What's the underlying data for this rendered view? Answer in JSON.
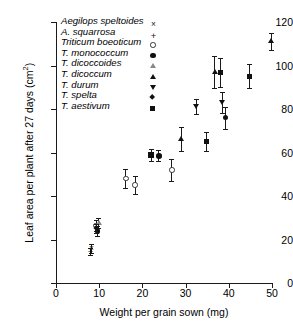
{
  "chart_data": {
    "type": "scatter",
    "title": "",
    "xlabel": "Weight per grain sown (mg)",
    "ylabel": "Leaf area per plant after 27 days (cm",
    "ylabel_sup": "2",
    "ylabel_tail": ")",
    "xlim": [
      0,
      50
    ],
    "ylim": [
      0,
      120
    ],
    "xticks": [
      0,
      10,
      20,
      30,
      40,
      50
    ],
    "yticks": [
      0,
      20,
      40,
      60,
      80,
      100,
      120
    ],
    "grid": false,
    "errorbars": "vertical",
    "legend_position": "inside-top-left",
    "series": [
      {
        "name": "Aegilops speltoides",
        "marker": "cross",
        "points": [
          {
            "x": 8.2,
            "y": 16.0,
            "err": 2.0
          }
        ]
      },
      {
        "name": "A. squarrosa",
        "marker": "plus",
        "points": [
          {
            "x": 8.0,
            "y": 14.5,
            "err": 1.8
          }
        ]
      },
      {
        "name": "Triticum boeoticum",
        "marker": "circle-open",
        "points": [
          {
            "x": 9.3,
            "y": 26.5,
            "err": 2.6
          },
          {
            "x": 16.2,
            "y": 48.0,
            "err": 4.2
          },
          {
            "x": 18.3,
            "y": 45.0,
            "err": 4.0
          },
          {
            "x": 26.8,
            "y": 52.0,
            "err": 5.0
          }
        ]
      },
      {
        "name": "T. monococcum",
        "marker": "circle-filled",
        "points": [
          {
            "x": 9.6,
            "y": 24.0,
            "err": 2.4
          },
          {
            "x": 23.8,
            "y": 58.5,
            "err": 2.6
          },
          {
            "x": 39.2,
            "y": 76.0,
            "err": 5.0
          }
        ]
      },
      {
        "name": "T. dicoccoides",
        "marker": "triangle-up-open",
        "points": [
          {
            "x": 9.9,
            "y": 27.5,
            "err": 2.4
          }
        ]
      },
      {
        "name": "T. dicoccum",
        "marker": "triangle-up-filled",
        "points": [
          {
            "x": 29.0,
            "y": 66.0,
            "err": 5.5
          },
          {
            "x": 36.8,
            "y": 97.0,
            "err": 7.5
          },
          {
            "x": 49.8,
            "y": 111.0,
            "err": 4.0
          }
        ]
      },
      {
        "name": "T. durum",
        "marker": "triangle-down-filled",
        "points": [
          {
            "x": 32.6,
            "y": 81.0,
            "err": 3.5
          },
          {
            "x": 38.6,
            "y": 83.0,
            "err": 5.0
          }
        ]
      },
      {
        "name": "T. spelta",
        "marker": "diamond-filled",
        "points": [
          {
            "x": 9.4,
            "y": 25.0,
            "err": 2.0
          }
        ]
      },
      {
        "name": "T. aestivum",
        "marker": "square-filled",
        "points": [
          {
            "x": 22.0,
            "y": 58.8,
            "err": 2.6
          },
          {
            "x": 34.8,
            "y": 65.0,
            "err": 4.5
          },
          {
            "x": 38.1,
            "y": 96.8,
            "err": 6.5
          },
          {
            "x": 44.8,
            "y": 95.0,
            "err": 5.5
          }
        ]
      }
    ]
  }
}
